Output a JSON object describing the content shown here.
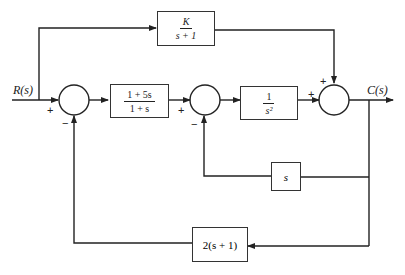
{
  "diagram": {
    "type": "block_diagram",
    "input_label": "R(s)",
    "output_label": "C(s)",
    "blocks": {
      "feedforward": {
        "numerator": "K",
        "denominator": "s + 1"
      },
      "controller": {
        "numerator": "1 + 5s",
        "denominator": "1 + s"
      },
      "plant": {
        "numerator": "1",
        "denominator": "s²"
      },
      "velocity_feedback": {
        "text": "s"
      },
      "outer_feedback": {
        "text": "2(s + 1)"
      }
    },
    "summing_junctions": {
      "sum1": {
        "plus": "+",
        "minus": "−"
      },
      "sum2": {
        "plus": "+",
        "minus": "−"
      },
      "sum3": {
        "plus_left": "+",
        "plus_top": "+"
      }
    },
    "colors": {
      "line": "#222222",
      "background": "#ffffff"
    }
  }
}
